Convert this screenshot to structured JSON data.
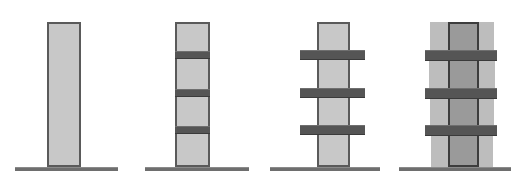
{
  "figure": {
    "title": "",
    "panel_count": 4,
    "canvas": {
      "width": 524,
      "height": 184,
      "background": "#ffffff"
    }
  },
  "colors": {
    "tower_fill": "#c8c8c8",
    "tower_outline": "#5a5a5a",
    "core_fill": "#9a9a9a",
    "core_outline": "#3d3d3d",
    "slab_fill": "#555555",
    "bulge_fill": "#bdbdbd",
    "ground_line": "#6e6e6e",
    "background": "#ffffff"
  },
  "geometry": {
    "ground_y": 167,
    "tower_top_y": 22,
    "tower_bottom_y": 167,
    "band_y": [
      51,
      89,
      126
    ],
    "band_height": 8
  },
  "panels": [
    {
      "id": "panel-1",
      "name": "bare-tower",
      "label": "",
      "ground": {
        "x": 15,
        "width": 103
      },
      "tower": {
        "x": 47,
        "width": 34
      },
      "slabs": [],
      "bulges": [],
      "col_lines": []
    },
    {
      "id": "panel-2",
      "name": "tower-with-flush-floor-bands",
      "label": "",
      "ground": {
        "x": 14,
        "width": 104
      },
      "tower": {
        "x": 44,
        "width": 35
      },
      "slabs": [
        {
          "x": 44,
          "y": 51,
          "width": 35,
          "height": 8
        },
        {
          "x": 44,
          "y": 89,
          "width": 35,
          "height": 8
        },
        {
          "x": 44,
          "y": 126,
          "width": 35,
          "height": 8
        }
      ],
      "bulges": [],
      "col_lines": []
    },
    {
      "id": "panel-3",
      "name": "tower-with-cantilevered-outriggers",
      "label": "",
      "ground": {
        "x": 8,
        "width": 110
      },
      "tower": {
        "x": 55,
        "width": 33
      },
      "slabs": [
        {
          "x": 38,
          "y": 50,
          "width": 65,
          "height": 10
        },
        {
          "x": 38,
          "y": 88,
          "width": 65,
          "height": 10
        },
        {
          "x": 38,
          "y": 125,
          "width": 65,
          "height": 10
        }
      ],
      "bulges": [],
      "col_lines": []
    },
    {
      "id": "panel-4",
      "name": "deformed-tower-with-outriggers",
      "label": "",
      "ground": {
        "x": 6,
        "width": 112
      },
      "tower": {
        "x": 55,
        "width": 31
      },
      "slabs": [
        {
          "x": 32,
          "y": 50,
          "width": 72,
          "height": 11
        },
        {
          "x": 32,
          "y": 88,
          "width": 72,
          "height": 11
        },
        {
          "x": 32,
          "y": 125,
          "width": 72,
          "height": 11
        }
      ],
      "bulges": [
        {
          "x": 37,
          "y": 22,
          "width": 64,
          "height": 30
        },
        {
          "x": 36,
          "y": 59,
          "width": 66,
          "height": 31
        },
        {
          "x": 37,
          "y": 97,
          "width": 64,
          "height": 30
        },
        {
          "x": 38,
          "y": 134,
          "width": 62,
          "height": 33
        }
      ],
      "col_lines": [
        {
          "x": 55,
          "y": 22,
          "height": 145
        },
        {
          "x": 84,
          "y": 22,
          "height": 145
        }
      ]
    }
  ]
}
